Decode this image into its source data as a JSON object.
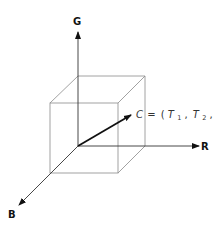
{
  "diagram": {
    "axes": {
      "g": {
        "label": "G"
      },
      "r": {
        "label": "R"
      },
      "b": {
        "label": "B"
      }
    },
    "vector": {
      "name": "C",
      "equals": "=",
      "open": "(",
      "t1": "T",
      "t1_sub": "1",
      "sep1": ",",
      "t2": "T",
      "t2_sub": "2",
      "sep2": ",",
      "t3": "T",
      "t3_sub": "3",
      "close": ")"
    },
    "colors": {
      "cube_edges": "#8a8a8a",
      "axes": "#333333",
      "vector": "#111111"
    }
  }
}
